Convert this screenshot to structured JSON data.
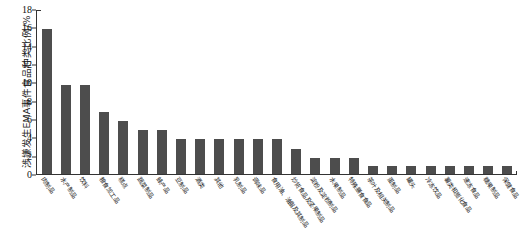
{
  "chart_data": {
    "type": "bar",
    "title": "",
    "xlabel": "",
    "ylabel": "涉嫌发生EMA事件食品种类比例/%",
    "ylim": [
      0,
      18
    ],
    "ytick_values": [
      0,
      2,
      4,
      6,
      8,
      10,
      12,
      14,
      16,
      18
    ],
    "ytick_labels": [
      "0",
      "2",
      "4",
      "6",
      "8",
      "10",
      "12",
      "14",
      "16",
      "18"
    ],
    "grid": false,
    "legend": "none",
    "bar_color": "#4d4d4d",
    "categories": [
      "肉制品",
      "水产制品",
      "饮料",
      "粮食加工品",
      "糕点",
      "蔬菜制品",
      "蜂产品",
      "豆制品",
      "酒类",
      "其他",
      "乳制品",
      "调味品",
      "食用油、油脂及其制品",
      "炒货食品及坚果制品",
      "淀粉及淀粉制品",
      "水果制品",
      "特殊膳食食品",
      "茶叶及相关制品",
      "蛋制品",
      "罐头",
      "冷冻饮品",
      "薯类和膨化食品",
      "速冻食品",
      "糖果制品",
      "保健食品"
    ],
    "values": [
      15.9,
      9.8,
      9.8,
      6.8,
      5.8,
      4.8,
      4.8,
      3.8,
      3.8,
      3.8,
      3.8,
      3.8,
      3.8,
      2.8,
      1.8,
      1.8,
      1.8,
      0.9,
      0.9,
      0.9,
      0.9,
      0.9,
      0.9,
      0.9,
      0.9
    ]
  }
}
